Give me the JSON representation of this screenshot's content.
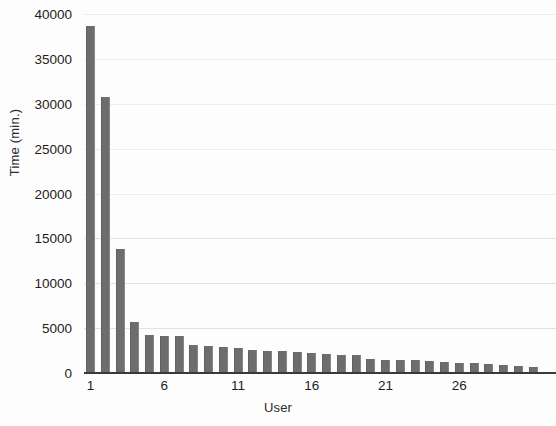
{
  "chart_data": {
    "type": "bar",
    "title": "",
    "xlabel": "User",
    "ylabel": "Time (min.)",
    "ylim": [
      0,
      40000
    ],
    "ytick_labels": [
      "40000",
      "35000",
      "30000",
      "25000",
      "20000",
      "15000",
      "10000",
      "5000",
      "0"
    ],
    "ytick_values": [
      40000,
      35000,
      30000,
      25000,
      20000,
      15000,
      10000,
      5000,
      0
    ],
    "xtick_labels": [
      "1",
      "6",
      "11",
      "16",
      "21",
      "26"
    ],
    "xtick_values": [
      1,
      6,
      11,
      16,
      21,
      26
    ],
    "grid": true,
    "legend": null,
    "bar_color": "#6d6d6d",
    "categories": [
      1,
      2,
      3,
      4,
      5,
      6,
      7,
      8,
      9,
      10,
      11,
      12,
      13,
      14,
      15,
      16,
      17,
      18,
      19,
      20,
      21,
      22,
      23,
      24,
      25,
      26,
      27,
      28,
      29,
      30,
      31
    ],
    "values": [
      38700,
      30700,
      13800,
      5700,
      4200,
      4150,
      4150,
      3100,
      3050,
      2900,
      2800,
      2600,
      2450,
      2400,
      2350,
      2200,
      2100,
      2050,
      2000,
      1600,
      1500,
      1450,
      1400,
      1300,
      1200,
      1150,
      1100,
      1050,
      900,
      800,
      700
    ]
  }
}
